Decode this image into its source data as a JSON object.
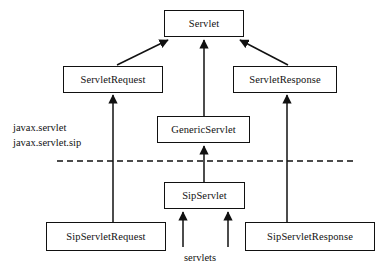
{
  "diagram": {
    "type": "uml-inheritance",
    "colors": {
      "background": "#ffffff",
      "stroke": "#111111",
      "text": "#111111"
    },
    "nodes": [
      {
        "id": "servlet",
        "label": "Servlet",
        "x": 164,
        "y": 10,
        "w": 80,
        "h": 27
      },
      {
        "id": "servlet-request",
        "label": "ServletRequest",
        "x": 63,
        "y": 66,
        "w": 100,
        "h": 27
      },
      {
        "id": "servlet-response",
        "label": "ServletResponse",
        "x": 233,
        "y": 66,
        "w": 104,
        "h": 27
      },
      {
        "id": "generic-servlet",
        "label": "GenericServlet",
        "x": 157,
        "y": 116,
        "w": 93,
        "h": 27
      },
      {
        "id": "sip-servlet",
        "label": "SipServlet",
        "x": 164,
        "y": 182,
        "w": 81,
        "h": 27
      },
      {
        "id": "sip-servlet-request",
        "label": "SipServletRequest",
        "x": 46,
        "y": 222,
        "w": 120,
        "h": 29
      },
      {
        "id": "sip-servlet-response",
        "label": "SipServletResponse",
        "x": 245,
        "y": 222,
        "w": 130,
        "h": 29
      }
    ],
    "edges": [
      {
        "id": "servlet-request-to-servlet",
        "from": "ServletRequest",
        "to": "Servlet",
        "style": "diagonal"
      },
      {
        "id": "generic-servlet-to-servlet",
        "from": "GenericServlet",
        "to": "Servlet",
        "style": "vertical"
      },
      {
        "id": "servlet-response-to-servlet",
        "from": "ServletResponse",
        "to": "Servlet",
        "style": "diagonal"
      },
      {
        "id": "sip-request-to-servlet-request",
        "from": "SipServletRequest",
        "to": "ServletRequest",
        "style": "vertical"
      },
      {
        "id": "sip-response-to-servlet-response",
        "from": "SipServletResponse",
        "to": "ServletResponse",
        "style": "vertical"
      },
      {
        "id": "sip-servlet-to-generic-servlet",
        "from": "SipServlet",
        "to": "GenericServlet",
        "style": "vertical"
      },
      {
        "id": "servlets-left-to-sip-servlet",
        "from": "servlets",
        "to": "SipServlet",
        "style": "vertical-stub"
      },
      {
        "id": "servlets-right-to-sip-servlet",
        "from": "servlets",
        "to": "SipServlet",
        "style": "vertical-stub"
      }
    ],
    "package_labels": {
      "upper": "javax.servlet",
      "lower": "javax.servlet.sip"
    },
    "separator": {
      "id": "package-separator",
      "style": "dashed",
      "y": 161,
      "x_start": 57,
      "x_end": 356
    },
    "caption": "servlets"
  }
}
